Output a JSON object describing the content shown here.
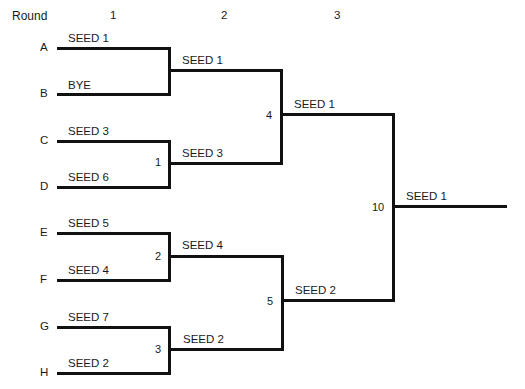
{
  "header": {
    "round_label": "Round",
    "rounds": [
      "1",
      "2",
      "3"
    ]
  },
  "round1": {
    "slots": [
      {
        "letter": "A",
        "entrant": "SEED 1"
      },
      {
        "letter": "B",
        "entrant": "BYE"
      },
      {
        "letter": "C",
        "entrant": "SEED 3"
      },
      {
        "letter": "D",
        "entrant": "SEED 6"
      },
      {
        "letter": "E",
        "entrant": "SEED 5"
      },
      {
        "letter": "F",
        "entrant": "SEED 4"
      },
      {
        "letter": "G",
        "entrant": "SEED 7"
      },
      {
        "letter": "H",
        "entrant": "SEED 2"
      }
    ],
    "games": [
      {
        "number": "",
        "winner": "SEED 1"
      },
      {
        "number": "1",
        "winner": "SEED 3"
      },
      {
        "number": "2",
        "winner": "SEED 4"
      },
      {
        "number": "3",
        "winner": "SEED 2"
      }
    ]
  },
  "round2": {
    "games": [
      {
        "number": "4",
        "winner": "SEED 1"
      },
      {
        "number": "5",
        "winner": "SEED 2"
      }
    ]
  },
  "round3": {
    "games": [
      {
        "number": "10",
        "winner": "SEED 1"
      }
    ]
  }
}
